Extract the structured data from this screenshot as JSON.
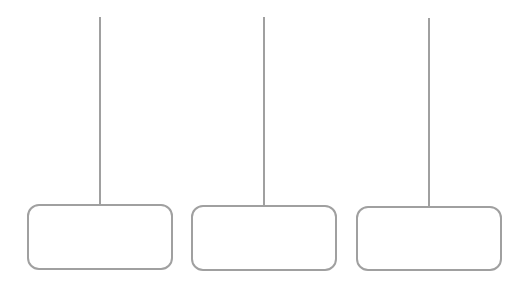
{
  "diagram": {
    "stroke_color": "#a0a0a0",
    "nodes": [
      {
        "label": "",
        "stem_x": 100,
        "stem_top": 17,
        "box": {
          "left": 27,
          "top": 204,
          "width": 146,
          "height": 66
        }
      },
      {
        "label": "",
        "stem_x": 264,
        "stem_top": 17,
        "box": {
          "left": 191,
          "top": 205,
          "width": 146,
          "height": 66
        }
      },
      {
        "label": "",
        "stem_x": 429,
        "stem_top": 18,
        "box": {
          "left": 356,
          "top": 206,
          "width": 146,
          "height": 65
        }
      }
    ]
  }
}
